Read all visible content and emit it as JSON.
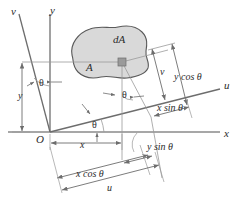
{
  "figure": {
    "type": "engineering-diagram",
    "width": 235,
    "height": 217,
    "colors": {
      "line": "#6d6d6d",
      "axis": "#8a8a8a",
      "blob_fill": "#d9d9d9",
      "blob_stroke": "#5a5a5a",
      "text": "#2b2b2b",
      "marker": "#9a9a9a",
      "background": "#ffffff"
    },
    "axes": [
      {
        "id": "x-axis",
        "label": "x",
        "label_x": 224,
        "label_y": 128
      },
      {
        "id": "y-axis",
        "label": "y",
        "label_x": 50,
        "label_y": 5
      },
      {
        "id": "u-axis",
        "label": "u",
        "label_x": 224,
        "label_y": 80
      },
      {
        "id": "v-axis",
        "label": "v",
        "label_x": 11,
        "label_y": 6
      }
    ],
    "origin": {
      "label": "O",
      "x": 36,
      "y": 134
    },
    "angles": [
      {
        "id": "theta-between-y-and-v",
        "label": "θ",
        "x": 39,
        "y": 78
      },
      {
        "id": "theta-at-dA",
        "label": "θ",
        "x": 122,
        "y": 90
      },
      {
        "id": "theta-at-origin",
        "label": "θ",
        "x": 92,
        "y": 120
      }
    ],
    "area": {
      "region_label": "A",
      "region_label_x": 86,
      "region_label_y": 62,
      "element_label": "dA",
      "element_label_x": 113,
      "element_label_y": 34,
      "element_marker_x": 122,
      "element_marker_y": 62
    },
    "dimensions": [
      {
        "id": "dim-y",
        "label": "y",
        "label_x": 18,
        "label_y": 91,
        "plain": false
      },
      {
        "id": "dim-x",
        "label": "x",
        "label_x": 80,
        "label_y": 140,
        "plain": false
      },
      {
        "id": "dim-v",
        "label": "v",
        "label_x": 160,
        "label_y": 67,
        "plain": false
      },
      {
        "id": "dim-y-cos",
        "label": "y cos θ",
        "label_x": 174,
        "label_y": 72,
        "plain": false
      },
      {
        "id": "dim-x-sin",
        "label": "x sin θ",
        "label_x": 157,
        "label_y": 103,
        "plain": false
      },
      {
        "id": "dim-y-sin",
        "label": "y sin θ",
        "label_x": 147,
        "label_y": 142,
        "plain": false
      },
      {
        "id": "dim-x-cos",
        "label": "x cos θ",
        "label_x": 76,
        "label_y": 169,
        "plain": false
      },
      {
        "id": "dim-u",
        "label": "u",
        "label_x": 107,
        "label_y": 183,
        "plain": false
      }
    ],
    "relations": {
      "u": "x cos θ + y sin θ",
      "v": "y cos θ − x sin θ"
    }
  }
}
